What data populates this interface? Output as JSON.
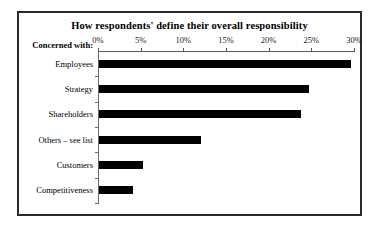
{
  "chart_data": {
    "type": "bar",
    "orientation": "horizontal",
    "title": "How respondents' define their overall responsibility",
    "xlabel": "",
    "ylabel": "Concerned with:",
    "categories": [
      "Employees",
      "Strategy",
      "Shareholders",
      "Others – see list",
      "Customers",
      "Competitiveness"
    ],
    "values": [
      29.5,
      24.6,
      23.7,
      12.0,
      5.2,
      4.0
    ],
    "xlim": [
      0,
      30
    ],
    "x_tick_labels": [
      "0%",
      "5%",
      "10%",
      "15%",
      "20%",
      "25%",
      "30%"
    ],
    "x_tick_values": [
      0,
      5,
      10,
      15,
      20,
      25,
      30
    ],
    "grid": false,
    "legend": false,
    "bar_color": "#000000",
    "background_color": "#ffffff",
    "border_color": "#2a2a2a"
  }
}
